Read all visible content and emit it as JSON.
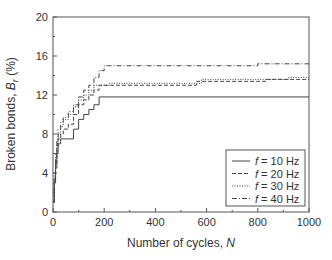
{
  "chart_data": {
    "type": "line",
    "title": "",
    "xlabel": "Number of cycles, N",
    "ylabel": "Broken bonds, B_r (%)",
    "ylabel_main": "Broken bonds, ",
    "ylabel_sym": "B",
    "ylabel_sub": "r",
    "ylabel_unit": " (%)",
    "xlabel_main": "Number of cycles, ",
    "xlabel_sym": "N",
    "xlim": [
      0,
      1000
    ],
    "ylim": [
      0,
      20
    ],
    "xticks": [
      0,
      200,
      400,
      600,
      800,
      1000
    ],
    "yticks": [
      0,
      4,
      8,
      12,
      16,
      20
    ],
    "grid": false,
    "legend_position": "lower right",
    "series": [
      {
        "name": "f = 10 Hz",
        "style": "solid",
        "x": [
          0,
          5,
          10,
          15,
          20,
          30,
          40,
          50,
          60,
          80,
          100,
          120,
          140,
          160,
          180,
          1000
        ],
        "y": [
          1,
          3,
          4.5,
          6,
          7,
          7.5,
          7.5,
          7.5,
          7.5,
          8.5,
          9.5,
          10,
          10.5,
          11,
          11.8,
          11.8
        ]
      },
      {
        "name": "f = 20 Hz",
        "style": "dashed",
        "x": [
          0,
          5,
          10,
          15,
          20,
          30,
          40,
          60,
          80,
          100,
          120,
          140,
          160,
          180,
          260,
          560,
          800,
          830,
          1000
        ],
        "y": [
          1,
          3,
          5,
          6.5,
          7.5,
          8,
          8.5,
          9,
          10,
          11,
          11.5,
          12,
          12.5,
          13,
          13,
          13.4,
          13.4,
          13.6,
          13.6
        ]
      },
      {
        "name": "f = 30 Hz",
        "style": "dotted",
        "x": [
          0,
          5,
          10,
          15,
          20,
          30,
          40,
          60,
          80,
          100,
          120,
          140,
          160,
          220,
          580,
          840,
          920,
          1000
        ],
        "y": [
          1,
          3.5,
          5.5,
          7,
          8,
          8.8,
          9.5,
          10,
          10.8,
          11.5,
          12,
          12.5,
          13,
          13.2,
          13.6,
          13.6,
          13.8,
          13.8
        ]
      },
      {
        "name": "f = 40 Hz",
        "style": "dashdot",
        "x": [
          0,
          5,
          10,
          15,
          20,
          30,
          40,
          60,
          80,
          100,
          120,
          140,
          160,
          180,
          200,
          220,
          800,
          1000
        ],
        "y": [
          1,
          4,
          6,
          7.5,
          8.5,
          9.2,
          9.7,
          10.3,
          11,
          11.8,
          12.5,
          13,
          13.8,
          14.5,
          15,
          15,
          15.2,
          15.2
        ]
      }
    ],
    "legend": [
      {
        "sym": "f",
        "text": " = 10 Hz",
        "style": "solid"
      },
      {
        "sym": "f",
        "text": " = 20 Hz",
        "style": "dashed"
      },
      {
        "sym": "f",
        "text": " = 30 Hz",
        "style": "dotted"
      },
      {
        "sym": "f",
        "text": " = 40 Hz",
        "style": "dashdot"
      }
    ]
  }
}
